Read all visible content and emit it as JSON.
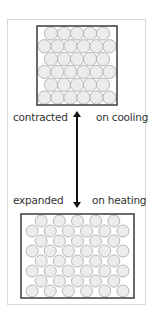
{
  "diagram": {
    "top_state": {
      "left_label": "contracted",
      "right_label": "on cooling",
      "box": {
        "x": 37,
        "y": 26,
        "w": 80,
        "h": 79
      },
      "rows": 6,
      "circle_diameter": 13.3
    },
    "bottom_state": {
      "left_label": "expanded",
      "right_label": "on heating",
      "box": {
        "x": 21,
        "y": 214,
        "w": 113,
        "h": 84
      },
      "rows": 8,
      "circle_diameter": 12
    },
    "arrow": {
      "direction": "bidirectional-vertical",
      "x": 77,
      "y1": 108,
      "y2": 211
    },
    "colors": {
      "circle_fill": "#ececec",
      "circle_stroke": "#a8a8a8",
      "box_stroke": "#3a3a3a",
      "arrow": "#111111",
      "frame": "#d8d8d8"
    }
  }
}
